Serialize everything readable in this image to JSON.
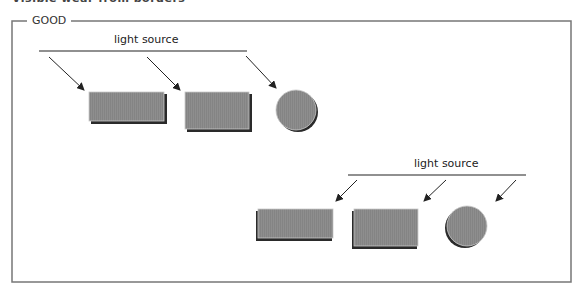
{
  "header": {
    "clipped_title": "Visible wear from borders"
  },
  "frame": {
    "label": "GOOD"
  },
  "diagram": {
    "group_top": {
      "light_label": "light source",
      "light_direction": "upper-left",
      "shapes": [
        "rectangle",
        "rectangle",
        "circle"
      ]
    },
    "group_bottom": {
      "light_label": "light source",
      "light_direction": "upper-right",
      "shapes": [
        "rectangle",
        "rectangle",
        "circle"
      ]
    },
    "colors": {
      "shape_fill": "#8c8c8c",
      "shadow": "#2a2a2a",
      "frame": "#777777",
      "line": "#222222"
    }
  }
}
